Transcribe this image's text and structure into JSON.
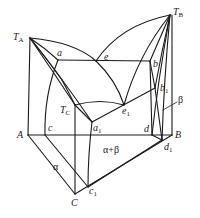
{
  "figure": {
    "type": "ternary-phase-diagram",
    "stroke_color": "#1a1a1a",
    "background": "#ffffff"
  },
  "labels": {
    "TA": {
      "main": "T",
      "sub": "A"
    },
    "TB": {
      "main": "T",
      "sub": "B"
    },
    "TC": {
      "main": "T",
      "sub": "C"
    },
    "a": "a",
    "e": "e",
    "b": "b",
    "b1": {
      "main": "b",
      "sub": "1"
    },
    "e1": {
      "main": "e",
      "sub": "1"
    },
    "a1": {
      "main": "a",
      "sub": "1"
    },
    "A": "A",
    "B": "B",
    "C": "C",
    "c": "c",
    "d": "d",
    "d1": {
      "main": "d",
      "sub": "1"
    },
    "c1": {
      "main": "c",
      "sub": "1"
    },
    "alpha": "α",
    "beta": "β",
    "alpha_beta": "α+β"
  }
}
